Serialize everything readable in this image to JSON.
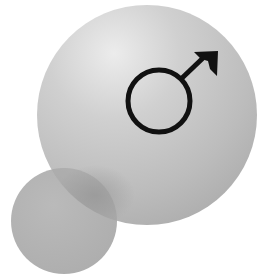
{
  "illustration": {
    "subject": "male gender symbol on spheres",
    "symbol_icon": "male-symbol-icon",
    "background_color": "#ffffff",
    "large_sphere": {
      "cx": 147,
      "cy": 115,
      "r": 110,
      "highlight_color": "#e6e6e6",
      "mid_color": "#c2c2c2",
      "shadow_color": "#a8a8a8"
    },
    "small_circle": {
      "cx": 64,
      "cy": 221,
      "r": 53,
      "color": "#b3b3b3",
      "overlap_shade": "#9c9c9c"
    },
    "symbol": {
      "ring_cx": 159,
      "ring_cy": 101,
      "ring_r": 31,
      "stroke_width": 5,
      "color": "#111111"
    }
  }
}
